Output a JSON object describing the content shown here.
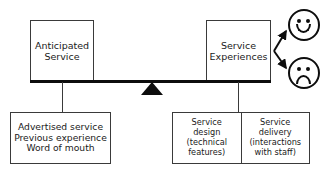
{
  "diagram": {
    "type": "seesaw-balance",
    "left_box": {
      "name": "anticipated-service",
      "lines": [
        "Anticipated",
        "Service"
      ]
    },
    "right_box": {
      "name": "service-experiences",
      "lines": [
        "Service",
        "Experiences"
      ]
    },
    "left_sources_box": {
      "name": "expectation-sources",
      "lines": [
        "Advertised service",
        "Previous experience",
        "Word of mouth"
      ]
    },
    "right_components_box": {
      "sub_boxes": [
        {
          "name": "service-design",
          "lines": [
            "Service",
            "design",
            "(technical",
            "features)"
          ]
        },
        {
          "name": "service-delivery",
          "lines": [
            "Service",
            "delivery",
            "(interactions",
            "with staff)"
          ]
        }
      ]
    },
    "outcomes": [
      {
        "name": "happy-face",
        "icon": "smiley-happy-icon",
        "sentiment": "satisfied"
      },
      {
        "name": "sad-face",
        "icon": "smiley-sad-icon",
        "sentiment": "dissatisfied"
      }
    ],
    "fulcrum": {
      "name": "fulcrum-triangle",
      "icon": "triangle-icon"
    },
    "colors": {
      "line": "#0d0d0d",
      "box_border": "#3a3a3a",
      "text": "#1a1a1a",
      "background": "#ffffff"
    }
  }
}
